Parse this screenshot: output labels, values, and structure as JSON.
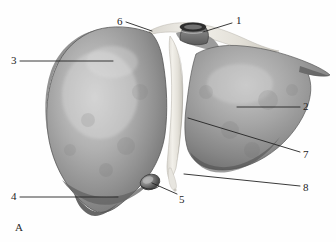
{
  "figure": {
    "panel_letter": "A",
    "view_title": "Liver, anterior view",
    "background_color": "#fefefe",
    "ink_color": "#242424",
    "organ_fill_dark": "#7d7d7d",
    "organ_fill_mid": "#9a9a9a",
    "organ_fill_light": "#c9c9c9",
    "ligament_color": "#e8e6e0",
    "vessel_color": "#3a3a3a"
  },
  "labels": [
    {
      "id": "1",
      "text": "1",
      "x": 236,
      "y": 15,
      "structure": "inferior-vena-cava",
      "leader": {
        "x1": 232,
        "y1": 23,
        "x2": 203,
        "y2": 32
      }
    },
    {
      "id": "2",
      "text": "2",
      "x": 303,
      "y": 101,
      "structure": "left-lobe",
      "leader": {
        "x1": 300,
        "y1": 107,
        "x2": 237,
        "y2": 107
      }
    },
    {
      "id": "3",
      "text": "3",
      "x": 11,
      "y": 55,
      "structure": "right-lobe",
      "leader": {
        "x1": 20,
        "y1": 61,
        "x2": 113,
        "y2": 61
      }
    },
    {
      "id": "4",
      "text": "4",
      "x": 11,
      "y": 191,
      "structure": "inferior-border-right-lobe",
      "leader": {
        "x1": 20,
        "y1": 197,
        "x2": 118,
        "y2": 197
      }
    },
    {
      "id": "5",
      "text": "5",
      "x": 179,
      "y": 194,
      "structure": "gallbladder",
      "leader": {
        "x1": 177,
        "y1": 194,
        "x2": 152,
        "y2": 183
      }
    },
    {
      "id": "6",
      "text": "6",
      "x": 117,
      "y": 16,
      "structure": "coronary-ligament-superior-border",
      "leader": {
        "x1": 126,
        "y1": 22,
        "x2": 152,
        "y2": 31
      }
    },
    {
      "id": "7",
      "text": "7",
      "x": 303,
      "y": 149,
      "structure": "falciform-ligament",
      "leader": {
        "x1": 300,
        "y1": 152,
        "x2": 188,
        "y2": 118
      }
    },
    {
      "id": "8",
      "text": "8",
      "x": 303,
      "y": 182,
      "structure": "ligamentum-teres-round-ligament",
      "leader": {
        "x1": 300,
        "y1": 186,
        "x2": 184,
        "y2": 174
      }
    }
  ]
}
